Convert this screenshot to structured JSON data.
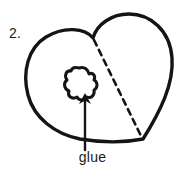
{
  "figure": {
    "step_number": "2.",
    "caption": "glue",
    "colors": {
      "ink": "#141414",
      "background": "#ffffff",
      "text": "#1a1a1a"
    },
    "shapes": {
      "heart_outline": "heart-shape",
      "glue_blob": "irregular-blob",
      "fold_line": "dashed-fold-line",
      "pointer": "arrow-pointing-up"
    },
    "annotation": {
      "arrow_target": "glue blob on left lobe of heart",
      "arrow_direction": "up"
    }
  }
}
